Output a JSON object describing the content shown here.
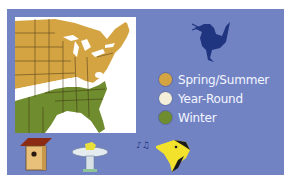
{
  "map": {
    "subject": "Eastern United States range map",
    "region_colors": {
      "spring_summer": "#d4a443",
      "year_round": "#ffffff",
      "winter": "#6f8c2e",
      "water": "#ffffff",
      "border": "#3a2c10"
    }
  },
  "panel": {
    "background": "#7283c4"
  },
  "bird_silhouette": {
    "icon": "songbird-silhouette-icon",
    "color": "#1f3580"
  },
  "legend": {
    "items": [
      {
        "label": "Spring/Summer",
        "color": "#d4a443"
      },
      {
        "label": "Year-Round",
        "color": "#f3efd9"
      },
      {
        "label": "Winter",
        "color": "#6f8c2e"
      }
    ]
  },
  "bottom_icons": [
    {
      "name": "birdhouse-icon"
    },
    {
      "name": "birdbath-icon"
    },
    {
      "name": "singing-bird-head-icon"
    }
  ]
}
